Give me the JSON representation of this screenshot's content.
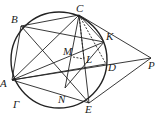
{
  "diagram": {
    "circle": {
      "cx": 59,
      "cy": 60,
      "r": 48,
      "label": "Γ"
    },
    "points": {
      "A": {
        "x": 12,
        "y": 80,
        "label": "A"
      },
      "B": {
        "x": 21,
        "y": 26,
        "label": "B"
      },
      "C": {
        "x": 79,
        "y": 15,
        "label": "C"
      },
      "K": {
        "x": 104,
        "y": 42,
        "label": "K"
      },
      "D": {
        "x": 106,
        "y": 64,
        "label": "D"
      },
      "E": {
        "x": 89,
        "y": 103,
        "label": "E"
      },
      "N": {
        "x": 65,
        "y": 88,
        "label": "N"
      },
      "M": {
        "x": 73,
        "y": 57,
        "label": "M"
      },
      "L": {
        "x": 84,
        "y": 59,
        "label": "L"
      },
      "P": {
        "x": 151,
        "y": 58,
        "label": "P"
      }
    },
    "circle_label": "Γ"
  }
}
